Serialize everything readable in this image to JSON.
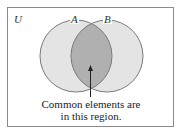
{
  "diagram": {
    "type": "venn",
    "universe_label": "U",
    "sets": [
      {
        "label": "A",
        "cx": 76,
        "cy": 56,
        "r": 36
      },
      {
        "label": "B",
        "cx": 107,
        "cy": 56,
        "r": 36
      }
    ],
    "caption": {
      "line1": "Common elements are",
      "line2": "in this region."
    },
    "colors": {
      "set_fill": "#e4e4e4",
      "intersection_fill": "#b0b0b0",
      "stroke": "#7a7a7a",
      "border": "#8a8a8a"
    }
  }
}
